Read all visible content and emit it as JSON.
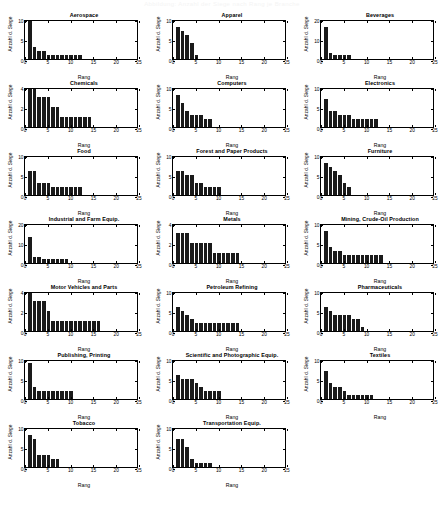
{
  "page": {
    "banner_text": "Abbildung: Anzahl der Siege nach Rang je Branche",
    "axis_labels": {
      "y": "Anzahl d. Siege",
      "x": "Rang"
    },
    "xticks": [
      0,
      5,
      10,
      15,
      20,
      25
    ],
    "xlim": [
      0,
      25
    ]
  },
  "chart_data": [
    {
      "type": "bar",
      "title": "Aerospace",
      "xlabel": "Rang",
      "ylabel": "Anzahl d. Siege",
      "xlim": [
        0,
        25
      ],
      "ylim": [
        0,
        10
      ],
      "yticks": [
        0,
        5,
        10
      ],
      "grid": false,
      "x": [
        1,
        2,
        3,
        4,
        5,
        6,
        7,
        8,
        9,
        10,
        11,
        12
      ],
      "values": [
        10,
        3,
        2,
        2,
        1,
        1,
        1,
        1,
        1,
        1,
        1,
        1
      ]
    },
    {
      "type": "bar",
      "title": "Apparel",
      "xlabel": "Rang",
      "ylabel": "Anzahl d. Siege",
      "xlim": [
        0,
        25
      ],
      "ylim": [
        0,
        10
      ],
      "yticks": [
        0,
        5,
        10
      ],
      "grid": false,
      "x": [
        1,
        2,
        3,
        4,
        5
      ],
      "values": [
        8,
        7,
        6,
        4,
        1
      ]
    },
    {
      "type": "bar",
      "title": "Beverages",
      "xlabel": "Rang",
      "ylabel": "Anzahl d. Siege",
      "xlim": [
        0,
        25
      ],
      "ylim": [
        0,
        20
      ],
      "yticks": [
        0,
        10,
        20
      ],
      "grid": false,
      "x": [
        1,
        2,
        3,
        4,
        5,
        6
      ],
      "values": [
        16,
        3,
        2,
        2,
        2,
        2
      ]
    },
    {
      "type": "bar",
      "title": "Chemicals",
      "xlabel": "Rang",
      "ylabel": "Anzahl d. Siege",
      "xlim": [
        0,
        25
      ],
      "ylim": [
        0,
        4
      ],
      "yticks": [
        0,
        2,
        4
      ],
      "grid": false,
      "x": [
        1,
        2,
        3,
        4,
        5,
        6,
        7,
        8,
        9,
        10,
        11,
        12,
        13,
        14
      ],
      "values": [
        4,
        4,
        3,
        3,
        3,
        2,
        2,
        1,
        1,
        1,
        1,
        1,
        1,
        1
      ]
    },
    {
      "type": "bar",
      "title": "Computers",
      "xlabel": "Rang",
      "ylabel": "Anzahl d. Siege",
      "xlim": [
        0,
        25
      ],
      "ylim": [
        0,
        10
      ],
      "yticks": [
        0,
        5,
        10
      ],
      "grid": false,
      "x": [
        1,
        2,
        3,
        4,
        5,
        6,
        7,
        8
      ],
      "values": [
        8,
        6,
        4,
        3,
        3,
        3,
        2,
        2
      ]
    },
    {
      "type": "bar",
      "title": "Electronics",
      "xlabel": "Rang",
      "ylabel": "Anzahl d. Siege",
      "xlim": [
        0,
        25
      ],
      "ylim": [
        0,
        10
      ],
      "yticks": [
        0,
        5,
        10
      ],
      "grid": false,
      "x": [
        1,
        2,
        3,
        4,
        5,
        6,
        7,
        8,
        9,
        10,
        11,
        12
      ],
      "values": [
        7,
        4,
        4,
        3,
        3,
        3,
        2,
        2,
        2,
        2,
        2,
        2
      ]
    },
    {
      "type": "bar",
      "title": "Food",
      "xlabel": "Rang",
      "ylabel": "Anzahl d. Siege",
      "xlim": [
        0,
        25
      ],
      "ylim": [
        0,
        10
      ],
      "yticks": [
        0,
        5,
        10
      ],
      "grid": false,
      "x": [
        1,
        2,
        3,
        4,
        5,
        6,
        7,
        8,
        9,
        10,
        11,
        12
      ],
      "values": [
        6,
        6,
        3,
        3,
        3,
        2,
        2,
        2,
        2,
        2,
        2,
        2
      ]
    },
    {
      "type": "bar",
      "title": "Forest and Paper Products",
      "xlabel": "Rang",
      "ylabel": "Anzahl d. Siege",
      "xlim": [
        0,
        25
      ],
      "ylim": [
        0,
        10
      ],
      "yticks": [
        0,
        5,
        10
      ],
      "grid": false,
      "x": [
        1,
        2,
        3,
        4,
        5,
        6,
        7,
        8,
        9,
        10
      ],
      "values": [
        6,
        6,
        5,
        5,
        3,
        3,
        2,
        2,
        2,
        2
      ]
    },
    {
      "type": "bar",
      "title": "Furniture",
      "xlabel": "Rang",
      "ylabel": "Anzahl d. Siege",
      "xlim": [
        0,
        25
      ],
      "ylim": [
        0,
        10
      ],
      "yticks": [
        0,
        5,
        10
      ],
      "grid": false,
      "x": [
        1,
        2,
        3,
        4,
        5,
        6
      ],
      "values": [
        8,
        7,
        6,
        5,
        3,
        2
      ]
    },
    {
      "type": "bar",
      "title": "Industrial and Farm Equip.",
      "xlabel": "Rang",
      "ylabel": "Anzahl d. Siege",
      "xlim": [
        0,
        25
      ],
      "ylim": [
        0,
        20
      ],
      "yticks": [
        0,
        10,
        20
      ],
      "grid": false,
      "x": [
        1,
        2,
        3,
        4,
        5,
        6,
        7,
        8,
        9
      ],
      "values": [
        13,
        3,
        3,
        2,
        2,
        2,
        2,
        2,
        2
      ]
    },
    {
      "type": "bar",
      "title": "Metals",
      "xlabel": "Rang",
      "ylabel": "Anzahl d. Siege",
      "xlim": [
        0,
        25
      ],
      "ylim": [
        0,
        4
      ],
      "yticks": [
        0,
        2,
        4
      ],
      "grid": false,
      "x": [
        1,
        2,
        3,
        4,
        5,
        6,
        7,
        8,
        9,
        10,
        11,
        12,
        13,
        14
      ],
      "values": [
        3,
        3,
        3,
        2,
        2,
        2,
        2,
        2,
        1,
        1,
        1,
        1,
        1,
        1
      ]
    },
    {
      "type": "bar",
      "title": "Mining, Crude-Oil Production",
      "xlabel": "Rang",
      "ylabel": "Anzahl d. Siege",
      "xlim": [
        0,
        25
      ],
      "ylim": [
        0,
        10
      ],
      "yticks": [
        0,
        5,
        10
      ],
      "grid": false,
      "x": [
        1,
        2,
        3,
        4,
        5,
        6,
        7,
        8,
        9,
        10,
        11,
        12,
        13
      ],
      "values": [
        8,
        4,
        3,
        3,
        2,
        2,
        2,
        2,
        2,
        2,
        2,
        2,
        2
      ]
    },
    {
      "type": "bar",
      "title": "Motor Vehicles and Parts",
      "xlabel": "Rang",
      "ylabel": "Anzahl d. Siege",
      "xlim": [
        0,
        25
      ],
      "ylim": [
        0,
        4
      ],
      "yticks": [
        0,
        2,
        4
      ],
      "grid": false,
      "x": [
        1,
        2,
        3,
        4,
        5,
        6,
        7,
        8,
        9,
        10,
        11,
        12,
        13,
        14,
        15,
        16
      ],
      "values": [
        4,
        3,
        3,
        3,
        2,
        1,
        1,
        1,
        1,
        1,
        1,
        1,
        1,
        1,
        1,
        1
      ]
    },
    {
      "type": "bar",
      "title": "Petroleum Refining",
      "xlabel": "Rang",
      "ylabel": "Anzahl d. Siege",
      "xlim": [
        0,
        25
      ],
      "ylim": [
        0,
        10
      ],
      "yticks": [
        0,
        5,
        10
      ],
      "grid": false,
      "x": [
        1,
        2,
        3,
        4,
        5,
        6,
        7,
        8,
        9,
        10,
        11,
        12,
        13,
        14
      ],
      "values": [
        6,
        5,
        4,
        3,
        2,
        2,
        2,
        2,
        2,
        2,
        2,
        2,
        2,
        2
      ]
    },
    {
      "type": "bar",
      "title": "Pharmaceuticals",
      "xlabel": "Rang",
      "ylabel": "Anzahl d. Siege",
      "xlim": [
        0,
        25
      ],
      "ylim": [
        0,
        10
      ],
      "yticks": [
        0,
        5,
        10
      ],
      "grid": false,
      "x": [
        1,
        2,
        3,
        4,
        5,
        6,
        7,
        8,
        9
      ],
      "values": [
        6,
        5,
        4,
        4,
        4,
        4,
        3,
        3,
        1
      ]
    },
    {
      "type": "bar",
      "title": "Publishing, Printing",
      "xlabel": "Rang",
      "ylabel": "Anzahl d. Siege",
      "xlim": [
        0,
        25
      ],
      "ylim": [
        0,
        10
      ],
      "yticks": [
        0,
        5,
        10
      ],
      "grid": false,
      "x": [
        1,
        2,
        3,
        4,
        5,
        6,
        7,
        8,
        9,
        10
      ],
      "values": [
        9,
        3,
        2,
        2,
        2,
        2,
        2,
        2,
        2,
        2
      ]
    },
    {
      "type": "bar",
      "title": "Scientific and Photographic Equip.",
      "xlabel": "Rang",
      "ylabel": "Anzahl d. Siege",
      "xlim": [
        0,
        25
      ],
      "ylim": [
        0,
        10
      ],
      "yticks": [
        0,
        5,
        10
      ],
      "grid": false,
      "x": [
        1,
        2,
        3,
        4,
        5,
        6,
        7,
        8,
        9,
        10
      ],
      "values": [
        6,
        5,
        5,
        5,
        4,
        3,
        2,
        2,
        2,
        2
      ]
    },
    {
      "type": "bar",
      "title": "Textiles",
      "xlabel": "Rang",
      "ylabel": "Anzahl d. Siege",
      "xlim": [
        0,
        25
      ],
      "ylim": [
        0,
        10
      ],
      "yticks": [
        0,
        5,
        10
      ],
      "grid": false,
      "x": [
        1,
        2,
        3,
        4,
        5,
        6,
        7,
        8,
        9,
        10,
        11
      ],
      "values": [
        7,
        4,
        3,
        3,
        2,
        1,
        1,
        1,
        1,
        1,
        1
      ]
    },
    {
      "type": "bar",
      "title": "Tobacco",
      "xlabel": "Rang",
      "ylabel": "Anzahl d. Siege",
      "xlim": [
        0,
        25
      ],
      "ylim": [
        0,
        10
      ],
      "yticks": [
        0,
        5,
        10
      ],
      "grid": false,
      "x": [
        1,
        2,
        3,
        4,
        5,
        6,
        7
      ],
      "values": [
        8,
        7,
        3,
        3,
        3,
        2,
        2
      ]
    },
    {
      "type": "bar",
      "title": "Transportation Equip.",
      "xlabel": "Rang",
      "ylabel": "Anzahl d. Siege",
      "xlim": [
        0,
        25
      ],
      "ylim": [
        0,
        10
      ],
      "yticks": [
        0,
        5,
        10
      ],
      "grid": false,
      "x": [
        1,
        2,
        3,
        4,
        5,
        6,
        7,
        8
      ],
      "values": [
        7,
        7,
        5,
        2,
        1,
        1,
        1,
        1
      ]
    }
  ]
}
